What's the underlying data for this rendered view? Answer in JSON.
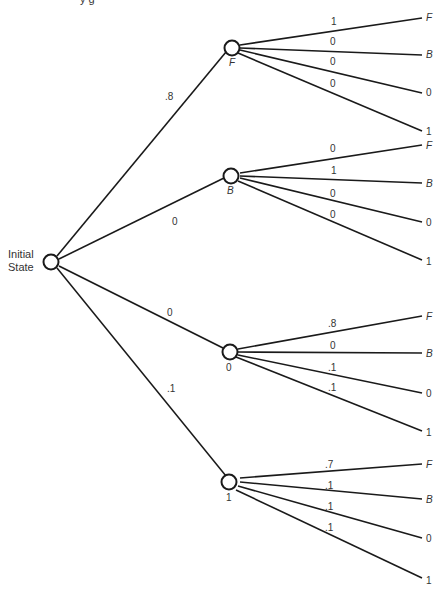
{
  "header_fragment": "y        g",
  "root": {
    "label_line1": "Initial",
    "label_line2": "State"
  },
  "first_level": [
    {
      "state": "F",
      "prob": ".8"
    },
    {
      "state": "B",
      "prob": "0"
    },
    {
      "state": "0",
      "prob": "0"
    },
    {
      "state": "1",
      "prob": ".1"
    }
  ],
  "second_level": [
    {
      "from": "F",
      "branches": [
        {
          "to": "F",
          "prob": "1"
        },
        {
          "to": "B",
          "prob": "0"
        },
        {
          "to": "0",
          "prob": "0"
        },
        {
          "to": "1",
          "prob": "0"
        }
      ]
    },
    {
      "from": "B",
      "branches": [
        {
          "to": "F",
          "prob": "0"
        },
        {
          "to": "B",
          "prob": "1"
        },
        {
          "to": "0",
          "prob": "0"
        },
        {
          "to": "1",
          "prob": "0"
        }
      ]
    },
    {
      "from": "0",
      "branches": [
        {
          "to": "F",
          "prob": ".8"
        },
        {
          "to": "B",
          "prob": "0"
        },
        {
          "to": "0",
          "prob": ".1"
        },
        {
          "to": "1",
          "prob": ".1"
        }
      ]
    },
    {
      "from": "1",
      "branches": [
        {
          "to": "F",
          "prob": ".7"
        },
        {
          "to": "B",
          "prob": ".1"
        },
        {
          "to": "0",
          "prob": ".1"
        },
        {
          "to": "1",
          "prob": ".1"
        }
      ]
    }
  ]
}
